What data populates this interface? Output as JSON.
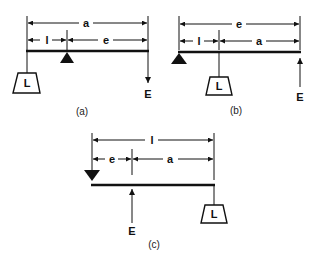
{
  "figure": {
    "panels": [
      {
        "id": "a",
        "caption": "(a)",
        "top_dimension": "a",
        "left_segment": "l",
        "right_segment": "e",
        "load_label": "L",
        "effort_label": "E",
        "fulcrum": "middle",
        "load_position": "left end",
        "effort_position": "right end",
        "effort_direction": "down"
      },
      {
        "id": "b",
        "caption": "(b)",
        "top_dimension": "e",
        "left_segment": "l",
        "right_segment": "a",
        "load_label": "L",
        "effort_label": "E",
        "fulcrum": "left end",
        "load_position": "middle",
        "effort_position": "right end",
        "effort_direction": "up"
      },
      {
        "id": "c",
        "caption": "(c)",
        "top_dimension": "l",
        "left_segment": "e",
        "right_segment": "a",
        "load_label": "L",
        "effort_label": "E",
        "fulcrum": "left end",
        "load_position": "right end",
        "effort_position": "middle",
        "effort_direction": "up"
      }
    ]
  }
}
